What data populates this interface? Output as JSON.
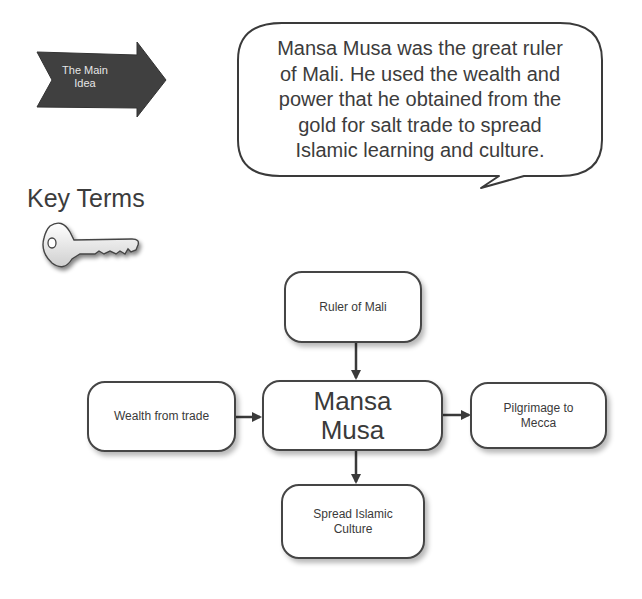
{
  "main_idea": {
    "label": "The Main Idea",
    "label_lines": [
      "The Main",
      "Idea"
    ],
    "shape": "notched-right-arrow",
    "fill": "#404040",
    "text_color": "#e6e6e6"
  },
  "speech_bubble": {
    "text": "Mansa Musa was the great ruler of Mali. He used the wealth and power that he obtained from the gold for salt trade to spread Islamic learning and culture.",
    "lines": [
      "Mansa Musa was the great ruler",
      "of Mali. He used the wealth and",
      "power that he obtained from the",
      "gold for salt trade to spread",
      "Islamic learning and culture."
    ]
  },
  "key_terms": {
    "title": "Key Terms",
    "icon": "key-icon"
  },
  "concept_map": {
    "center": {
      "id": "center",
      "lines": [
        "Mansa",
        "Musa"
      ]
    },
    "nodes": [
      {
        "id": "top",
        "lines": [
          "Ruler of Mali"
        ],
        "relation": "points-to-center"
      },
      {
        "id": "left",
        "lines": [
          "Wealth from trade"
        ],
        "relation": "points-to-center"
      },
      {
        "id": "right",
        "lines": [
          "Pilgrimage to",
          "Mecca"
        ],
        "relation": "from-center"
      },
      {
        "id": "bottom",
        "lines": [
          "Spread Islamic",
          "Culture"
        ],
        "relation": "from-center"
      }
    ]
  },
  "colors": {
    "stroke": "#454545",
    "text": "#3a3a3a",
    "background": "#ffffff"
  }
}
